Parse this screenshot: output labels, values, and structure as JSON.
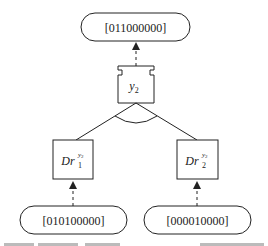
{
  "diagram": {
    "type": "and-decomposition tree",
    "nodes": {
      "top_state": {
        "label": "[011000000]"
      },
      "goal": {
        "label": "y",
        "subscript": "2"
      },
      "left_driver": {
        "label": "Dr",
        "subscript": "1",
        "superscript": "y",
        "superscript_sub": "2"
      },
      "right_driver": {
        "label": "Dr",
        "subscript": "2",
        "superscript": "y",
        "superscript_sub": "2"
      },
      "left_state": {
        "label": "[010100000]"
      },
      "right_state": {
        "label": "[000010000]"
      }
    },
    "edges": [
      {
        "from": "goal",
        "to": "top_state",
        "style": "dashed-arrow"
      },
      {
        "from": "goal",
        "to": "left_driver",
        "style": "solid"
      },
      {
        "from": "goal",
        "to": "right_driver",
        "style": "solid"
      },
      {
        "from": "left_state",
        "to": "left_driver",
        "style": "dashed-arrow"
      },
      {
        "from": "right_state",
        "to": "right_driver",
        "style": "dashed-arrow"
      }
    ],
    "and_arc": true,
    "colors": {
      "stroke": "#222222",
      "background": "#ffffff"
    }
  }
}
